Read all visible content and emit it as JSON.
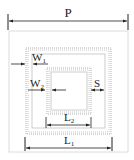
{
  "diagram": {
    "labels": {
      "P": "P",
      "W1_main": "W",
      "W1_sub": "1",
      "W2_main": "W",
      "W2_sub": "2",
      "S": "S",
      "L2_main": "L",
      "L2_sub": "2",
      "L1_main": "L",
      "L1_sub": "1"
    },
    "colors": {
      "line": "#222222",
      "substrate_border": "#d8d8d8",
      "ring_dots": "#aaaaaa"
    }
  }
}
